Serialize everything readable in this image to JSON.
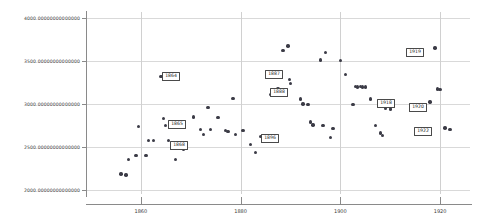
{
  "chart_data": {
    "type": "scatter",
    "title": "",
    "xlabel": "",
    "ylabel": "",
    "xlim": [
      1849,
      1926
    ],
    "ylim": [
      1950,
      4070
    ],
    "grid": true,
    "legend": null,
    "x_ticks": [
      "1860",
      "1880",
      "1900",
      "1920"
    ],
    "x_tick_values": [
      1860,
      1880,
      1900,
      1920
    ],
    "y_ticks": [
      "2000.00000000000000",
      "2500.00000000000000",
      "3000.00000000000000",
      "3500.00000000000000",
      "4000.00000000000000"
    ],
    "y_tick_values": [
      2000,
      2500,
      3000,
      3500,
      4000
    ],
    "marker_color": "#3b3b46",
    "grid_color": "#d9d9d9",
    "axis_color": "#8a8a8a",
    "points": [
      {
        "x": 1856,
        "y": 2182
      },
      {
        "x": 1857,
        "y": 2172
      },
      {
        "x": 1857.5,
        "y": 2352
      },
      {
        "x": 1859,
        "y": 2400
      },
      {
        "x": 1859.5,
        "y": 2735
      },
      {
        "x": 1861,
        "y": 2398
      },
      {
        "x": 1861.5,
        "y": 2570
      },
      {
        "x": 1862.5,
        "y": 2572
      },
      {
        "x": 1864,
        "y": 3320
      },
      {
        "x": 1864.5,
        "y": 2830
      },
      {
        "x": 1865,
        "y": 2745
      },
      {
        "x": 1865.5,
        "y": 2570
      },
      {
        "x": 1866.5,
        "y": 2545
      },
      {
        "x": 1867,
        "y": 2355
      },
      {
        "x": 1868,
        "y": 2520
      },
      {
        "x": 1868.5,
        "y": 2475
      },
      {
        "x": 1870.5,
        "y": 2845
      },
      {
        "x": 1872,
        "y": 2700
      },
      {
        "x": 1872.5,
        "y": 2645
      },
      {
        "x": 1873.5,
        "y": 2955
      },
      {
        "x": 1874,
        "y": 2698
      },
      {
        "x": 1875.5,
        "y": 2840
      },
      {
        "x": 1877,
        "y": 2692
      },
      {
        "x": 1877.5,
        "y": 2680
      },
      {
        "x": 1878.5,
        "y": 3060
      },
      {
        "x": 1879,
        "y": 2645
      },
      {
        "x": 1880.5,
        "y": 2690
      },
      {
        "x": 1882,
        "y": 2530
      },
      {
        "x": 1883,
        "y": 2430
      },
      {
        "x": 1884,
        "y": 2618
      },
      {
        "x": 1884.5,
        "y": 2612
      },
      {
        "x": 1886,
        "y": 3110
      },
      {
        "x": 1887,
        "y": 3345
      },
      {
        "x": 1887.5,
        "y": 3175
      },
      {
        "x": 1887.8,
        "y": 3170
      },
      {
        "x": 1888,
        "y": 3165
      },
      {
        "x": 1888.5,
        "y": 3625
      },
      {
        "x": 1889.5,
        "y": 3672
      },
      {
        "x": 1889.8,
        "y": 3285
      },
      {
        "x": 1890,
        "y": 3240
      },
      {
        "x": 1892,
        "y": 3055
      },
      {
        "x": 1892.5,
        "y": 3000
      },
      {
        "x": 1893.5,
        "y": 2995
      },
      {
        "x": 1894,
        "y": 2790
      },
      {
        "x": 1894.5,
        "y": 2755
      },
      {
        "x": 1896,
        "y": 3510
      },
      {
        "x": 1896.5,
        "y": 2750
      },
      {
        "x": 1897,
        "y": 3600
      },
      {
        "x": 1898,
        "y": 2608
      },
      {
        "x": 1898.5,
        "y": 2715
      },
      {
        "x": 1900,
        "y": 3505
      },
      {
        "x": 1901,
        "y": 3340
      },
      {
        "x": 1902.5,
        "y": 2995
      },
      {
        "x": 1903,
        "y": 3205
      },
      {
        "x": 1903.5,
        "y": 3195
      },
      {
        "x": 1904,
        "y": 3200
      },
      {
        "x": 1904.5,
        "y": 3197
      },
      {
        "x": 1905,
        "y": 3195
      },
      {
        "x": 1906,
        "y": 3055
      },
      {
        "x": 1907,
        "y": 2745
      },
      {
        "x": 1908,
        "y": 2660
      },
      {
        "x": 1908.5,
        "y": 2635
      },
      {
        "x": 1909,
        "y": 2945
      },
      {
        "x": 1910,
        "y": 2940
      },
      {
        "x": 1918,
        "y": 3020
      },
      {
        "x": 1919,
        "y": 3650
      },
      {
        "x": 1919.5,
        "y": 3175
      },
      {
        "x": 1920,
        "y": 3165
      },
      {
        "x": 1921,
        "y": 2720
      },
      {
        "x": 1922,
        "y": 2700
      }
    ],
    "annotations": [
      {
        "label": "1864",
        "point_x": 1864,
        "point_y": 3320,
        "box_left": 162,
        "box_top": 72
      },
      {
        "label": "1865",
        "point_x": 1865,
        "point_y": 2745,
        "box_left": 168,
        "box_top": 120
      },
      {
        "label": "1868",
        "point_x": 1868,
        "point_y": 2520,
        "box_left": 170,
        "box_top": 141
      },
      {
        "label": "1887",
        "point_x": 1887,
        "point_y": 3345,
        "box_left": 265,
        "box_top": 70
      },
      {
        "label": "1888",
        "point_x": 1888,
        "point_y": 3165,
        "box_left": 270,
        "box_top": 88
      },
      {
        "label": "1896",
        "point_x": 1896.5,
        "point_y": 2750,
        "box_left": 261,
        "box_top": 134
      },
      {
        "label": "1918",
        "point_x": 1918,
        "point_y": 3020,
        "box_left": 377,
        "box_top": 99
      },
      {
        "label": "1919",
        "point_x": 1919,
        "point_y": 3650,
        "box_left": 406,
        "box_top": 48
      },
      {
        "label": "1920",
        "point_x": 1920,
        "point_y": 3165,
        "box_left": 409,
        "box_top": 103
      },
      {
        "label": "1922",
        "point_x": 1922,
        "point_y": 2700,
        "box_left": 414,
        "box_top": 127
      }
    ]
  }
}
